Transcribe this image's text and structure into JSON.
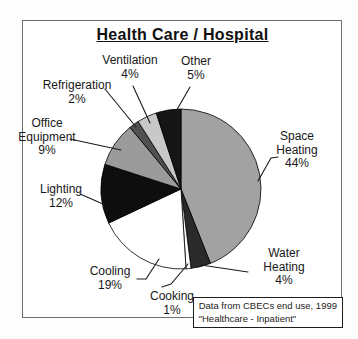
{
  "title": "Health Care / Hospital",
  "chart_data": {
    "type": "pie",
    "title": "Health Care / Hospital",
    "categories": [
      "Space Heating",
      "Water Heating",
      "Cooking",
      "Cooling",
      "Lighting",
      "Office Equipment",
      "Refrigeration",
      "Ventilation",
      "Other"
    ],
    "values": [
      44,
      4,
      1,
      19,
      12,
      9,
      2,
      4,
      5
    ],
    "unit": "%",
    "start_angle_deg": 0,
    "direction": "clockwise",
    "slices": [
      {
        "label": "Space Heating",
        "pct": 44,
        "color": "#a2a2a2"
      },
      {
        "label": "Water Heating",
        "pct": 4,
        "color": "#2a2a2a"
      },
      {
        "label": "Cooking",
        "pct": 1,
        "color": "#ffffff"
      },
      {
        "label": "Cooling",
        "pct": 19,
        "color": "#ffffff"
      },
      {
        "label": "Lighting",
        "pct": 12,
        "color": "#0e0e0e"
      },
      {
        "label": "Office Equipment",
        "pct": 9,
        "color": "#9b9b9b"
      },
      {
        "label": "Refrigeration",
        "pct": 2,
        "color": "#505050"
      },
      {
        "label": "Ventilation",
        "pct": 4,
        "color": "#c8c8c8"
      },
      {
        "label": "Other",
        "pct": 5,
        "color": "#151515"
      }
    ],
    "callouts": {
      "ventilation": {
        "lines": [
          "Ventilation",
          "4%"
        ]
      },
      "other": {
        "lines": [
          "Other",
          "5%"
        ]
      },
      "refrigeration": {
        "lines": [
          "Refrigeration",
          "2%"
        ]
      },
      "office_equipment": {
        "lines": [
          "Office",
          "Equipment",
          "9%"
        ]
      },
      "lighting": {
        "lines": [
          "Lighting",
          "12%"
        ]
      },
      "space_heating": {
        "lines": [
          "Space",
          "Heating",
          "44%"
        ]
      },
      "water_heating": {
        "lines": [
          "Water",
          "Heating",
          "4%"
        ]
      },
      "cooling": {
        "lines": [
          "Cooling",
          "19%"
        ]
      },
      "cooking": {
        "lines": [
          "Cooking",
          "1%"
        ]
      }
    },
    "source_note": [
      "Data from CBECs end use, 1999",
      "\"Healthcare - Inpatient\""
    ]
  }
}
